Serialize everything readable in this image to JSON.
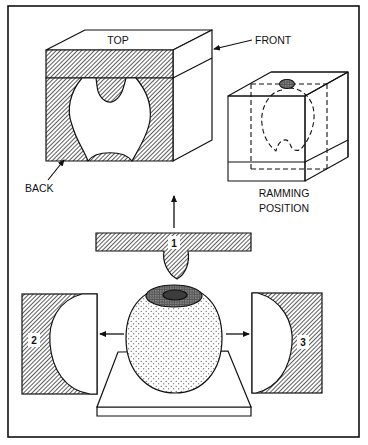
{
  "figure": {
    "type": "technical-illustration",
    "colors": {
      "line": "#111111",
      "hatch_fill": "#555555",
      "background": "#ffffff",
      "stipple": "#222222"
    }
  },
  "labels": {
    "top": "TOP",
    "front": "FRONT",
    "back": "BACK",
    "ramming_line1": "RAMMING",
    "ramming_line2": "POSITION"
  },
  "parts": [
    {
      "id": "part-1",
      "number": "1",
      "description": "top T-shaped mold piece with plug, pulled upward"
    },
    {
      "id": "part-2",
      "number": "2",
      "description": "left half mold with concave cavity, pulled left"
    },
    {
      "id": "part-3",
      "number": "3",
      "description": "right half mold with concave cavity, pulled right"
    }
  ],
  "arrows": [
    {
      "id": "arrow-up",
      "direction": "up"
    },
    {
      "id": "arrow-left",
      "direction": "left"
    },
    {
      "id": "arrow-right",
      "direction": "right"
    },
    {
      "id": "arrow-front",
      "direction": "left",
      "points_to": "front"
    },
    {
      "id": "arrow-back",
      "direction": "up-right",
      "points_to": "back"
    }
  ]
}
